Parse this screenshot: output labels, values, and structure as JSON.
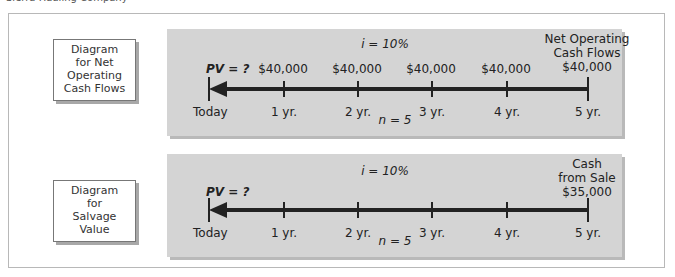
{
  "caption": "Sierra Hauling Company",
  "diagrams": [
    {
      "label": "Diagram for Net Operating Cash Flows",
      "label_lines": [
        "Diagram",
        "for Net",
        "Operating",
        "Cash Flows"
      ],
      "rate": "i = 10%",
      "periods": "n = 5",
      "pv": "PV = ?",
      "header_lines": [
        "Net Operating",
        "Cash Flows"
      ],
      "amounts": [
        "$40,000",
        "$40,000",
        "$40,000",
        "$40,000",
        "$40,000"
      ],
      "timeline": [
        "Today",
        "1 yr.",
        "2 yr.",
        "3 yr.",
        "4 yr.",
        "5 yr."
      ]
    },
    {
      "label": "Diagram for Salvage Value",
      "label_lines": [
        "Diagram",
        "for",
        "Salvage",
        "Value"
      ],
      "rate": "i = 10%",
      "periods": "n = 5",
      "pv": "PV = ?",
      "header_lines": [
        "Cash",
        "from Sale",
        "$35,000"
      ],
      "timeline": [
        "Today",
        "1 yr.",
        "2 yr.",
        "3 yr.",
        "4 yr.",
        "5 yr."
      ]
    }
  ],
  "colors": {
    "panel": "#d4d4d4",
    "line": "#222222",
    "border": "#b8b8b8"
  }
}
